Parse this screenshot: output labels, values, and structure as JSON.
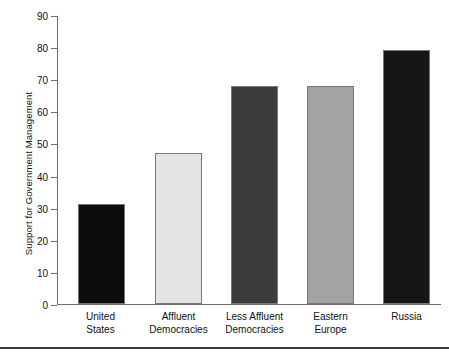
{
  "chart_data": {
    "type": "bar",
    "title": "",
    "xlabel": "",
    "ylabel": "Support for Government Management",
    "categories": [
      "United States",
      "Affluent Democracies",
      "Less Affluent Democracies",
      "Eastern Europe",
      "Russia"
    ],
    "category_lines": [
      [
        "United",
        "States"
      ],
      [
        "Affluent",
        "Democracies"
      ],
      [
        "Less Affluent",
        "Democracies"
      ],
      [
        "Eastern",
        "Europe"
      ],
      [
        "Russia",
        ""
      ]
    ],
    "values": [
      31,
      47,
      68,
      68,
      79
    ],
    "ylim": [
      0,
      90
    ],
    "yticks": [
      0,
      10,
      20,
      30,
      40,
      50,
      60,
      70,
      80,
      90
    ],
    "ytick_labels": [
      "0",
      "10",
      "20",
      "30",
      "40",
      "50",
      "60",
      "70",
      "80",
      "90"
    ],
    "grid": false,
    "legend": "none",
    "bar_colors": [
      "#0d0d0d",
      "#e4e4e4",
      "#3b3b3b",
      "#a3a3a3",
      "#161616"
    ],
    "bar_edge_color": "#777777",
    "axis_color": "#6d6d6d"
  }
}
